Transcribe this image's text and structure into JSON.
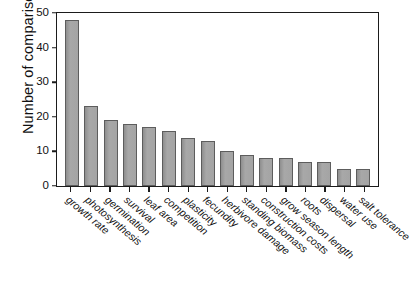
{
  "chart_data": {
    "type": "bar",
    "title": "",
    "xlabel": "",
    "ylabel": "Number of comparisons",
    "ylim": [
      0,
      50
    ],
    "yticks": [
      0,
      10,
      20,
      30,
      40,
      50
    ],
    "grid": false,
    "legend": null,
    "bar_color": "#9d9d9d",
    "bar_edge_color": "#5d5d5d",
    "categories": [
      "growth rate",
      "photosynthesis",
      "germination",
      "survival",
      "leaf area",
      "competition",
      "plasticity",
      "fecundity",
      "herbivore damage",
      "standing biomass",
      "construction costs",
      "grow season length",
      "roots",
      "dispersal",
      "water use",
      "salt tolerance"
    ],
    "values": [
      48,
      23,
      19,
      18,
      17,
      16,
      14,
      13,
      10,
      9,
      8,
      8,
      7,
      7,
      5,
      5
    ]
  }
}
